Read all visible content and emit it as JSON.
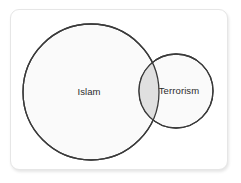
{
  "figure": {
    "kind": "venn-diagram",
    "background_color": "#ffffff",
    "card": {
      "background_color": "#ffffff",
      "border_color": "#e6e6e6",
      "corner_radius": 9
    },
    "sets": [
      {
        "id": "islam",
        "label": "Islam",
        "shape": "circle",
        "cx": 80,
        "cy": 82,
        "r": 68,
        "fill_color": "#fafafa",
        "stroke_color": "#3a3a3a",
        "label_x": 78,
        "label_y": 82
      },
      {
        "id": "terrorism",
        "label": "Terrorism",
        "shape": "circle",
        "cx": 165,
        "cy": 81,
        "r": 37,
        "fill_color": "#fafafa",
        "stroke_color": "#3a3a3a",
        "label_x": 168,
        "label_y": 81
      }
    ],
    "intersection": {
      "id": "islam-terrorism-overlap",
      "between": [
        "islam",
        "terrorism"
      ],
      "label": "",
      "fill_color": "#e0e0e0"
    },
    "label_text_color": "#2b2b2b"
  }
}
